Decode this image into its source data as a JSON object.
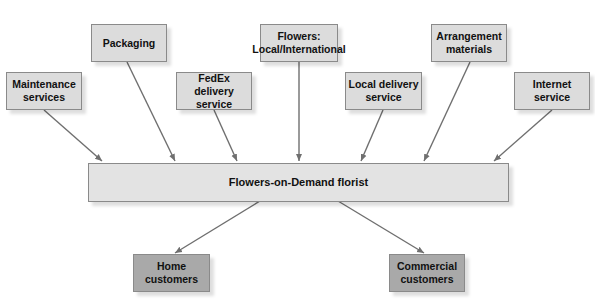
{
  "diagram": {
    "type": "supply-chain",
    "center": {
      "label": "Flowers-on-Demand florist"
    },
    "suppliers": [
      {
        "id": "maintenance",
        "label": "Maintenance\nservices"
      },
      {
        "id": "packaging",
        "label": "Packaging"
      },
      {
        "id": "fedex",
        "label": "FedEx delivery\nservice"
      },
      {
        "id": "flowers",
        "label": "Flowers:\nLocal/International"
      },
      {
        "id": "local-delivery",
        "label": "Local delivery\nservice"
      },
      {
        "id": "arrangement",
        "label": "Arrangement\nmaterials"
      },
      {
        "id": "internet",
        "label": "Internet\nservice"
      }
    ],
    "customers": [
      {
        "id": "home",
        "label": "Home\ncustomers"
      },
      {
        "id": "commercial",
        "label": "Commercial\ncustomers"
      }
    ],
    "edges": [
      {
        "from": "maintenance",
        "to": "center"
      },
      {
        "from": "packaging",
        "to": "center"
      },
      {
        "from": "fedex",
        "to": "center"
      },
      {
        "from": "flowers",
        "to": "center"
      },
      {
        "from": "local-delivery",
        "to": "center"
      },
      {
        "from": "arrangement",
        "to": "center"
      },
      {
        "from": "internet",
        "to": "center"
      },
      {
        "from": "center",
        "to": "home"
      },
      {
        "from": "center",
        "to": "commercial"
      }
    ],
    "colors": {
      "supplier_fill": "#dcdcdc",
      "center_fill": "#e3e3e3",
      "customer_fill": "#a9a9a9",
      "arrow": "#6f6f6f"
    }
  }
}
